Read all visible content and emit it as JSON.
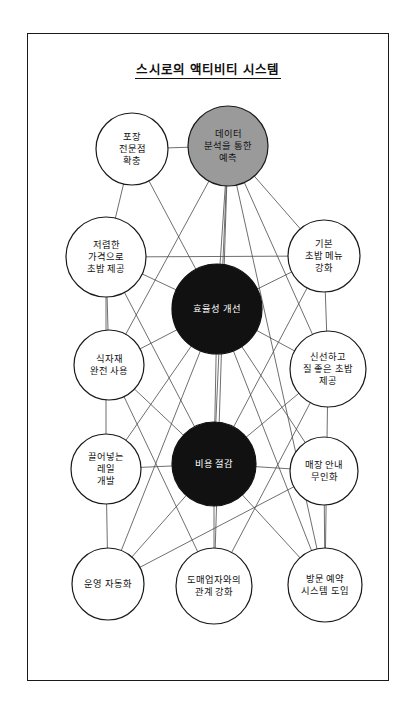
{
  "diagram": {
    "title": "스시로의 액티비티 시스템",
    "type": "activity-system-map",
    "frame": {
      "x": 27,
      "y": 33,
      "width": 362,
      "height": 648
    },
    "style": {
      "node_stroke": "#1a1a1a",
      "node_fill_white": "#ffffff",
      "node_fill_gray": "#9a9a9a",
      "node_fill_black": "#111111",
      "edge_color": "#4a4a4a",
      "label_color_on_light": "#111111",
      "label_color_on_dark": "#ffffff"
    },
    "nodes": [
      {
        "id": "packaging",
        "label": "포장\n전문점\n확충",
        "cx": 104,
        "cy": 115,
        "r": 36,
        "fill": "white",
        "text": "dark"
      },
      {
        "id": "prediction",
        "label": "데이터\n분석을 통한\n예측",
        "cx": 200,
        "cy": 112,
        "r": 40,
        "fill": "gray",
        "text": "dark"
      },
      {
        "id": "cheapsushi",
        "label": "저렴한\n가격으로\n초밥 제공",
        "cx": 78,
        "cy": 223,
        "r": 40,
        "fill": "white",
        "text": "dark"
      },
      {
        "id": "basicmenu",
        "label": "기본\n초밥 메뉴\n강화",
        "cx": 296,
        "cy": 222,
        "r": 36,
        "fill": "white",
        "text": "dark"
      },
      {
        "id": "efficiency",
        "label": "효율성 개선",
        "cx": 189,
        "cy": 275,
        "r": 45,
        "fill": "black",
        "text": "light"
      },
      {
        "id": "ingredients",
        "label": "식자재\n완전 사용",
        "cx": 81,
        "cy": 331,
        "r": 35,
        "fill": "white",
        "text": "dark"
      },
      {
        "id": "freshsushi",
        "label": "신선하고\n질 좋은 초밥\n제공",
        "cx": 300,
        "cy": 335,
        "r": 38,
        "fill": "white",
        "text": "dark"
      },
      {
        "id": "rail",
        "label": "끌어넣는\n레일\n개발",
        "cx": 78,
        "cy": 435,
        "r": 35,
        "fill": "white",
        "text": "dark"
      },
      {
        "id": "costcut",
        "label": "비용 절감",
        "cx": 186,
        "cy": 430,
        "r": 42,
        "fill": "black",
        "text": "light"
      },
      {
        "id": "storeguide",
        "label": "매장 안내\n무인화",
        "cx": 296,
        "cy": 437,
        "r": 34,
        "fill": "white",
        "text": "dark"
      },
      {
        "id": "automation",
        "label": "운영 자동화",
        "cx": 80,
        "cy": 550,
        "r": 36,
        "fill": "white",
        "text": "dark"
      },
      {
        "id": "wholesale",
        "label": "도매업자와의\n관계 강화",
        "cx": 186,
        "cy": 552,
        "r": 38,
        "fill": "white",
        "text": "dark"
      },
      {
        "id": "reservation",
        "label": "방문 예약\n시스템 도입",
        "cx": 297,
        "cy": 551,
        "r": 37,
        "fill": "white",
        "text": "dark"
      }
    ],
    "edges": [
      [
        "packaging",
        "efficiency"
      ],
      [
        "packaging",
        "prediction"
      ],
      [
        "packaging",
        "cheapsushi"
      ],
      [
        "prediction",
        "efficiency"
      ],
      [
        "prediction",
        "basicmenu"
      ],
      [
        "prediction",
        "costcut"
      ],
      [
        "prediction",
        "freshsushi"
      ],
      [
        "prediction",
        "ingredients"
      ],
      [
        "prediction",
        "reservation"
      ],
      [
        "prediction",
        "wholesale"
      ],
      [
        "cheapsushi",
        "efficiency"
      ],
      [
        "cheapsushi",
        "basicmenu"
      ],
      [
        "cheapsushi",
        "ingredients"
      ],
      [
        "cheapsushi",
        "costcut"
      ],
      [
        "cheapsushi",
        "rail"
      ],
      [
        "basicmenu",
        "efficiency"
      ],
      [
        "basicmenu",
        "freshsushi"
      ],
      [
        "basicmenu",
        "costcut"
      ],
      [
        "efficiency",
        "ingredients"
      ],
      [
        "efficiency",
        "costcut"
      ],
      [
        "efficiency",
        "rail"
      ],
      [
        "efficiency",
        "storeguide"
      ],
      [
        "efficiency",
        "automation"
      ],
      [
        "efficiency",
        "reservation"
      ],
      [
        "efficiency",
        "freshsushi"
      ],
      [
        "ingredients",
        "costcut"
      ],
      [
        "ingredients",
        "wholesale"
      ],
      [
        "freshsushi",
        "costcut"
      ],
      [
        "freshsushi",
        "wholesale"
      ],
      [
        "freshsushi",
        "reservation"
      ],
      [
        "rail",
        "costcut"
      ],
      [
        "rail",
        "automation"
      ],
      [
        "costcut",
        "storeguide"
      ],
      [
        "costcut",
        "automation"
      ],
      [
        "costcut",
        "wholesale"
      ],
      [
        "costcut",
        "reservation"
      ],
      [
        "storeguide",
        "reservation"
      ],
      [
        "storeguide",
        "automation"
      ]
    ]
  }
}
